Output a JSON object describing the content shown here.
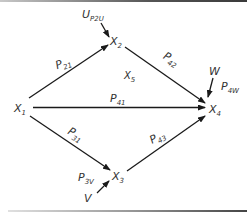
{
  "diagram": {
    "type": "path-diagram",
    "nodes": [
      {
        "id": "X1",
        "label": "X",
        "sub": "1"
      },
      {
        "id": "X2",
        "label": "X",
        "sub": "2"
      },
      {
        "id": "X3",
        "label": "X",
        "sub": "3"
      },
      {
        "id": "X4",
        "label": "X",
        "sub": "4"
      },
      {
        "id": "X5",
        "label": "X",
        "sub": "5"
      }
    ],
    "exogenous": [
      {
        "id": "U",
        "label": "U",
        "sub": "P2U"
      },
      {
        "id": "W",
        "label": "W",
        "sub": ""
      },
      {
        "id": "V",
        "label": "V",
        "sub": ""
      }
    ],
    "edges": [
      {
        "from": "X1",
        "to": "X2",
        "label": "P",
        "sub": "21"
      },
      {
        "from": "X2",
        "to": "X4",
        "label": "P",
        "sub": "42"
      },
      {
        "from": "X1",
        "to": "X4",
        "label": "P",
        "sub": "41"
      },
      {
        "from": "X1",
        "to": "X3",
        "label": "P",
        "sub": "31"
      },
      {
        "from": "X3",
        "to": "X4",
        "label": "P",
        "sub": "43"
      },
      {
        "from": "U",
        "to": "X2",
        "label": "",
        "sub": ""
      },
      {
        "from": "W",
        "to": "X4",
        "label": "P",
        "sub": "4W"
      },
      {
        "from": "V",
        "to": "X3",
        "label": "P",
        "sub": "3V"
      }
    ],
    "colors": {
      "line": "#1a1a1a",
      "text": "#333333",
      "background": "#ffffff"
    }
  }
}
